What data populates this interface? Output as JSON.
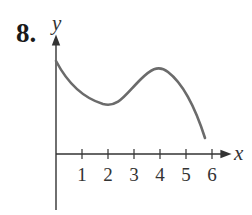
{
  "problem_number": "8.",
  "chart_data": {
    "type": "line",
    "title": "",
    "xlabel": "x",
    "ylabel": "y",
    "x_ticks": [
      1,
      2,
      3,
      4,
      5,
      6
    ],
    "y_ticks": [],
    "xlim": [
      0,
      6.3
    ],
    "grid": false,
    "series": [
      {
        "name": "f(x)",
        "x": [
          0,
          0.5,
          1,
          1.5,
          1.8,
          2.2,
          2.6,
          3,
          3.5,
          3.8,
          4,
          4.3,
          4.7,
          5,
          5.3,
          5.6,
          5.85
        ],
        "y": [
          3.6,
          2.9,
          2.5,
          2.1,
          2.0,
          2.05,
          2.5,
          3.0,
          3.35,
          3.45,
          3.4,
          3.2,
          2.8,
          2.3,
          1.7,
          0.95,
          0.6
        ],
        "note": "qualitative curve; y-axis unlabeled: starts high, local min near x=2, local max near x=3.8, decreasing toward x-axis near x=5.8"
      }
    ]
  }
}
